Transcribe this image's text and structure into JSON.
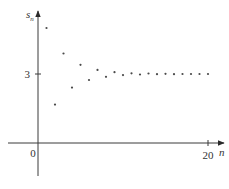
{
  "chart_data": {
    "type": "scatter",
    "title": "",
    "xlabel": "n",
    "ylabel": "s_n",
    "ylabel_main": "s",
    "ylabel_sub": "n",
    "x_ticks": [
      {
        "value": 20,
        "label": "20"
      }
    ],
    "y_ticks": [
      {
        "value": 3,
        "label": "3"
      }
    ],
    "origin_label": "0",
    "xlim": [
      -3.5,
      21.5
    ],
    "ylim": [
      -1.5,
      5.7
    ],
    "grid": false,
    "legend": null,
    "x": [
      1,
      2,
      3,
      4,
      5,
      6,
      7,
      8,
      9,
      10,
      11,
      12,
      13,
      14,
      15,
      16,
      17,
      18,
      19,
      20
    ],
    "values": [
      5.0,
      1.67,
      3.89,
      2.41,
      3.4,
      2.74,
      3.18,
      2.88,
      3.08,
      2.95,
      3.03,
      2.98,
      3.02,
      2.99,
      3.01,
      2.99,
      3.0,
      3.0,
      3.0,
      3.0
    ],
    "limit_value": 3
  }
}
